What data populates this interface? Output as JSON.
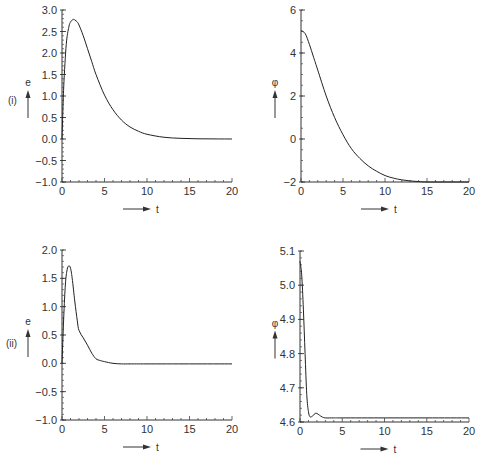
{
  "chart_data": [
    {
      "id": "i-e",
      "type": "line",
      "row_label": "(i)",
      "ylabel": "e",
      "xlabel": "t",
      "xlim": [
        0,
        20
      ],
      "ylim": [
        -1.0,
        3.0
      ],
      "xticks": [
        "0",
        "5",
        "10",
        "15",
        "20"
      ],
      "yticks": [
        "-1.0",
        "-0.5",
        "0.0",
        "0.5",
        "1.0",
        "1.5",
        "2.0",
        "2.5",
        "3.0"
      ],
      "x": [
        0,
        0.2,
        0.5,
        0.8,
        1.0,
        1.3,
        1.5,
        1.8,
        2.0,
        2.5,
        3.0,
        3.5,
        4.0,
        5.0,
        6.0,
        7.0,
        8.0,
        9.0,
        10.0,
        12.0,
        14.0,
        16.0,
        18.0,
        20.0
      ],
      "y": [
        0,
        1.2,
        2.2,
        2.6,
        2.72,
        2.78,
        2.77,
        2.72,
        2.65,
        2.4,
        2.1,
        1.8,
        1.5,
        1.02,
        0.68,
        0.44,
        0.28,
        0.18,
        0.11,
        0.04,
        0.015,
        0.005,
        0.002,
        0.0
      ]
    },
    {
      "id": "i-phi",
      "type": "line",
      "ylabel": "φ",
      "xlabel": "t",
      "xlim": [
        0,
        20
      ],
      "ylim": [
        -2,
        6
      ],
      "xticks": [
        "0",
        "5",
        "10",
        "15",
        "20"
      ],
      "yticks": [
        "-2",
        "0",
        "2",
        "4",
        "6"
      ],
      "x": [
        0,
        0.5,
        1.0,
        1.5,
        2.0,
        3.0,
        4.0,
        5.0,
        6.0,
        7.0,
        8.0,
        9.0,
        10.0,
        11.0,
        12.0,
        13.0,
        14.0,
        15.0,
        17.0,
        20.0
      ],
      "y": [
        5.05,
        4.9,
        4.4,
        3.8,
        3.2,
        2.0,
        1.0,
        0.2,
        -0.45,
        -0.9,
        -1.25,
        -1.5,
        -1.7,
        -1.82,
        -1.9,
        -1.95,
        -1.98,
        -2.0,
        -2.0,
        -2.0
      ]
    },
    {
      "id": "ii-e",
      "type": "line",
      "row_label": "(ii)",
      "ylabel": "e",
      "xlabel": "t",
      "xlim": [
        0,
        20
      ],
      "ylim": [
        -1.0,
        2.0
      ],
      "xticks": [
        "0",
        "5",
        "10",
        "15",
        "20"
      ],
      "yticks": [
        "-1.0",
        "-0.5",
        "0.0",
        "0.5",
        "1.0",
        "1.5",
        "2.0"
      ],
      "x": [
        0,
        0.2,
        0.4,
        0.6,
        0.8,
        1.0,
        1.2,
        1.5,
        1.8,
        2.0,
        2.5,
        3.0,
        3.5,
        4.0,
        4.5,
        5.0,
        6.0,
        7.0,
        8.0,
        10.0,
        15.0,
        20.0
      ],
      "y": [
        0,
        0.8,
        1.4,
        1.65,
        1.72,
        1.68,
        1.5,
        1.1,
        0.75,
        0.58,
        0.45,
        0.32,
        0.18,
        0.08,
        0.05,
        0.03,
        0.0,
        -0.01,
        -0.01,
        -0.01,
        -0.01,
        -0.01
      ]
    },
    {
      "id": "ii-phi",
      "type": "line",
      "ylabel": "φ",
      "xlabel": "t",
      "xlim": [
        0,
        20
      ],
      "ylim": [
        4.6,
        5.1
      ],
      "xticks": [
        "0",
        "5",
        "10",
        "15",
        "20"
      ],
      "yticks": [
        "4.6",
        "4.7",
        "4.8",
        "4.9",
        "5.0",
        "5.1"
      ],
      "x": [
        0,
        0.2,
        0.4,
        0.6,
        0.8,
        1.0,
        1.2,
        1.5,
        1.8,
        2.0,
        2.3,
        2.6,
        3.0,
        4.0,
        5.0,
        10.0,
        15.0,
        20.0
      ],
      "y": [
        5.07,
        5.03,
        4.93,
        4.8,
        4.68,
        4.63,
        4.615,
        4.618,
        4.625,
        4.625,
        4.62,
        4.615,
        4.612,
        4.612,
        4.612,
        4.612,
        4.612,
        4.612
      ]
    }
  ],
  "panels": {
    "row1_label": "(i)",
    "row2_label": "(ii)",
    "e_label": "e",
    "phi_label": "φ",
    "t_label": "t"
  }
}
